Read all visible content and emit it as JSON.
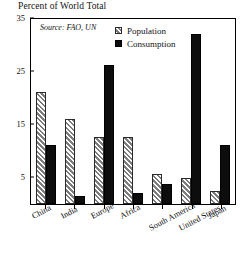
{
  "chart_data": {
    "type": "bar",
    "title": "",
    "ylabel": "Percent of World Total",
    "xlabel": "",
    "ylim": [
      0,
      35
    ],
    "yticks": [
      5,
      15,
      25,
      35
    ],
    "ytick_labels": [
      "5",
      "15",
      "25",
      "35"
    ],
    "grid": false,
    "legend_position": "top-center",
    "annotation": "Source: FAO, UN",
    "categories": [
      "China",
      "India",
      "Europe",
      "Africa",
      "South America",
      "United States",
      "Japan"
    ],
    "series": [
      {
        "name": "Population",
        "values": [
          21.0,
          16.0,
          12.5,
          12.5,
          5.6,
          4.8,
          2.5
        ]
      },
      {
        "name": "Consumption",
        "values": [
          11.0,
          1.5,
          26.2,
          2.0,
          3.8,
          32.0,
          11.0
        ]
      }
    ]
  },
  "axis": {
    "y_title": "Percent of World Total"
  },
  "legend": {
    "items": [
      {
        "label": "Population",
        "swatch": "hatched-gray-swatch",
        "color": "#7d7d7d"
      },
      {
        "label": "Consumption",
        "swatch": "solid-black-swatch",
        "color": "#0d0d0d"
      }
    ]
  },
  "source": {
    "text": "Source: FAO, UN"
  }
}
